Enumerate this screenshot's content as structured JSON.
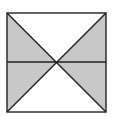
{
  "diagram": {
    "shape": "square-with-diagonals-and-midline",
    "colors": {
      "shade": "#c8c8c8",
      "stroke": "#222222",
      "background": "#ffffff"
    },
    "square": {
      "x": 7,
      "y": 13,
      "size": 99
    },
    "shaded_regions": [
      "left-triangle",
      "right-triangle"
    ]
  }
}
